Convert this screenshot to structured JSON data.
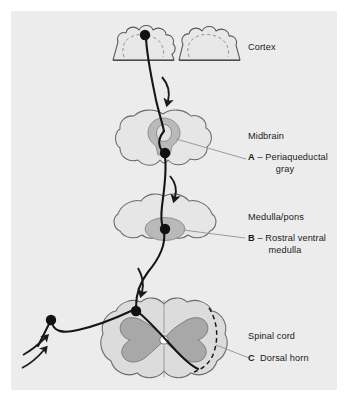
{
  "figure": {
    "background_color": "#ffffff",
    "panel_color": "#ececed",
    "ink_color": "#1a1a1a",
    "structure_fill": "#e3e3e3",
    "structure_fill_dark": "#b4b4b4",
    "structure_fill_mid": "#cfcfcf",
    "outline_color": "#6e6e6e",
    "leader_color": "#8c8c8c"
  },
  "labels": {
    "cortex": "Cortex",
    "midbrain": "Midbrain",
    "midbrain_letter": "A",
    "midbrain_dash": "–",
    "midbrain_structure_line1": "Periaqueductal",
    "midbrain_structure_line2": "gray",
    "medulla": "Medulla/pons",
    "medulla_letter": "B",
    "medulla_dash": "–",
    "medulla_structure_line1": "Rostral ventral",
    "medulla_structure_line2": "medulla",
    "spinal_cord": "Spinal cord",
    "spinal_letter": "C",
    "spinal_structure": "Dorsal horn"
  },
  "structures": [
    {
      "name": "cortex",
      "label": "Cortex",
      "marker": null
    },
    {
      "name": "midbrain",
      "label": "Midbrain",
      "marker": "A",
      "substructure": "Periaqueductal gray"
    },
    {
      "name": "medulla-pons",
      "label": "Medulla/pons",
      "marker": "B",
      "substructure": "Rostral ventral medulla"
    },
    {
      "name": "spinal-cord",
      "label": "Spinal cord",
      "marker": "C",
      "substructure": "Dorsal horn"
    }
  ]
}
